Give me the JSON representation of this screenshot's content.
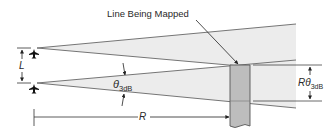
{
  "title_label": "Line Being Mapped",
  "dimensions": {
    "L": {
      "symbol": "L"
    },
    "theta": {
      "symbol": "θ",
      "subscript": "3dB"
    },
    "R": {
      "symbol": "R"
    },
    "R_theta": {
      "symbol": "Rθ",
      "subscript": "3dB"
    }
  },
  "icons": {
    "aircraft_top": "aircraft-icon",
    "aircraft_bottom": "aircraft-icon"
  },
  "colors": {
    "beam_fill": "#ececec",
    "line_stroke": "#555555",
    "target_fill": "#bdbdbd",
    "text": "#2a2a2a"
  }
}
